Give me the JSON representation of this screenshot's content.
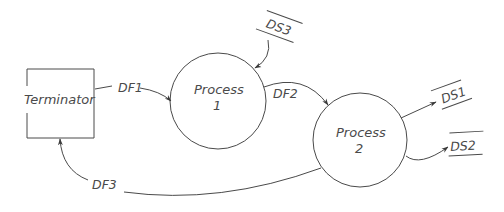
{
  "diagram": {
    "type": "data-flow-diagram",
    "terminator": {
      "label": "Terminator"
    },
    "processes": [
      {
        "id": "process-1",
        "label_line1": "Process",
        "label_line2": "1"
      },
      {
        "id": "process-2",
        "label_line1": "Process",
        "label_line2": "2"
      }
    ],
    "data_stores": [
      {
        "id": "ds1",
        "label": "DS1"
      },
      {
        "id": "ds2",
        "label": "DS2"
      },
      {
        "id": "ds3",
        "label": "DS3"
      }
    ],
    "data_flows": [
      {
        "id": "df1",
        "label": "DF1",
        "from": "Terminator",
        "to": "Process 1"
      },
      {
        "id": "df2",
        "label": "DF2",
        "from": "Process 1",
        "to": "Process 2"
      },
      {
        "id": "df3",
        "label": "DF3",
        "from": "Process 2",
        "to": "Terminator"
      },
      {
        "id": "ds3-flow",
        "label": "",
        "from": "DS3",
        "to": "Process 1"
      },
      {
        "id": "ds1-flow",
        "label": "",
        "from": "Process 2",
        "to": "DS1"
      },
      {
        "id": "ds2-flow",
        "label": "",
        "from": "Process 2",
        "to": "DS2"
      }
    ],
    "colors": {
      "line": "#4a4a4a",
      "background": "#ffffff"
    }
  }
}
